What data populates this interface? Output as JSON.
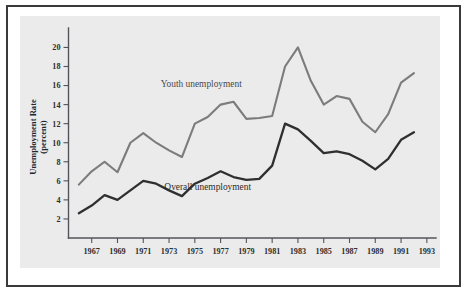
{
  "figure": {
    "background_color": "#ffffff",
    "frame_color": "#3a3a3a",
    "panel_color": "#ebebeb"
  },
  "chart_data": {
    "type": "line",
    "title": "",
    "xlabel": "",
    "ylabel": "Unemployment Rate (percent)",
    "ylabel_line1": "Unemployment Rate",
    "ylabel_line2": "(percent)",
    "xlim": [
      1965,
      1993
    ],
    "ylim": [
      0,
      21
    ],
    "grid": false,
    "legend_position": "inline-annotations",
    "y_ticks": [
      2,
      4,
      6,
      8,
      10,
      12,
      14,
      16,
      18,
      20
    ],
    "y_tick_labels": [
      "2",
      "4",
      "6",
      "8",
      "10",
      "12",
      "14",
      "16",
      "18",
      "20"
    ],
    "x_ticks": [
      1967,
      1969,
      1971,
      1973,
      1975,
      1977,
      1979,
      1981,
      1983,
      1985,
      1987,
      1989,
      1991,
      1993
    ],
    "x_tick_labels": [
      "1967",
      "1969",
      "1971",
      "1973",
      "1975",
      "1977",
      "1979",
      "1981",
      "1983",
      "1985",
      "1987",
      "1989",
      "1991",
      "1993"
    ],
    "x": [
      1966,
      1967,
      1968,
      1969,
      1970,
      1971,
      1972,
      1973,
      1974,
      1975,
      1976,
      1977,
      1978,
      1979,
      1980,
      1981,
      1982,
      1983,
      1984,
      1985,
      1986,
      1987,
      1988,
      1989,
      1990,
      1991,
      1992
    ],
    "series": [
      {
        "name": "Youth unemployment",
        "color": "#7c7c7c",
        "label": "Youth unemployment",
        "values": [
          5.6,
          7.0,
          8.0,
          6.9,
          10.0,
          11.0,
          10.0,
          9.2,
          8.5,
          12.0,
          12.7,
          14.0,
          14.3,
          12.5,
          12.6,
          12.8,
          18.0,
          20.0,
          16.5,
          14.0,
          14.9,
          14.6,
          12.2,
          11.1,
          13.0,
          16.3,
          17.3
        ]
      },
      {
        "name": "Overall unemployment",
        "color": "#2f2f2f",
        "label": "Overall unemployment",
        "values": [
          2.6,
          3.4,
          4.5,
          4.0,
          5.0,
          6.0,
          5.7,
          5.0,
          4.4,
          5.7,
          6.3,
          7.0,
          6.4,
          6.1,
          6.2,
          7.6,
          12.0,
          11.4,
          10.2,
          8.9,
          9.1,
          8.8,
          8.1,
          7.2,
          8.3,
          10.3,
          11.1
        ]
      }
    ],
    "annotations": [
      {
        "text": "Youth unemployment",
        "x": 1975.5,
        "y": 15.8
      },
      {
        "text": "Overall unemployment",
        "x": 1976.0,
        "y": 5.0
      }
    ]
  }
}
